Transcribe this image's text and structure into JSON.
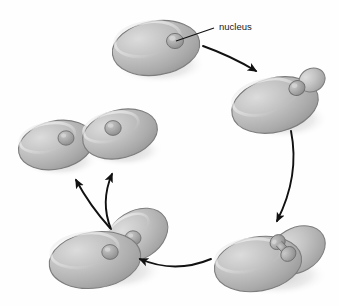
{
  "figure": {
    "background_color": "#fefefe"
  },
  "labels": {
    "nucleus": "nucleus"
  },
  "colors": {
    "cell_fill_light": "#d2d2d2",
    "cell_fill_mid": "#b4b4b4",
    "cell_fill_dark": "#9a9a9a",
    "cell_outline": "#7d7d7d",
    "nucleus_fill": "#a8a8a8",
    "nucleus_outline": "#6f6f6f",
    "shadow": "#c9c9c9",
    "arrow": "#111111",
    "leader_line": "#111111",
    "text": "#1a1a1a"
  },
  "stages": [
    {
      "id": "stage-1-parent-cell",
      "name": "unbudded parent cell",
      "position": {
        "cx": 156,
        "cy": 48
      },
      "has_bud": false,
      "nucleus_count": 1
    },
    {
      "id": "stage-2-small-bud",
      "name": "cell with small emerging bud",
      "position": {
        "cx": 277,
        "cy": 103
      },
      "has_bud": true,
      "nucleus_count": 1
    },
    {
      "id": "stage-3-large-bud-dividing-nucleus",
      "name": "cell with large bud and dividing nucleus",
      "position": {
        "cx": 268,
        "cy": 259
      },
      "has_bud": true,
      "nucleus_count": 1
    },
    {
      "id": "stage-4-separating-cells",
      "name": "parent and daughter cell separating, each with a nucleus",
      "position": {
        "cx": 108,
        "cy": 252
      },
      "has_bud": true,
      "nucleus_count": 2
    },
    {
      "id": "stage-5-daughter-cell-left",
      "name": "separated daughter cell left",
      "position": {
        "cx": 56,
        "cy": 145
      },
      "has_bud": false,
      "nucleus_count": 1
    },
    {
      "id": "stage-5-daughter-cell-right",
      "name": "separated daughter cell right",
      "position": {
        "cx": 120,
        "cy": 134
      },
      "has_bud": false,
      "nucleus_count": 1
    }
  ],
  "arrows": [
    {
      "id": "arrow-stage1-to-stage2",
      "from": "stage-1-parent-cell",
      "to": "stage-2-small-bud",
      "direction": "right-down"
    },
    {
      "id": "arrow-stage2-to-stage3",
      "from": "stage-2-small-bud",
      "to": "stage-3-large-bud-dividing-nucleus",
      "direction": "down"
    },
    {
      "id": "arrow-stage3-to-stage4",
      "from": "stage-3-large-bud-dividing-nucleus",
      "to": "stage-4-separating-cells",
      "direction": "left"
    },
    {
      "id": "arrow-stage4-to-daughter-left",
      "from": "stage-4-separating-cells",
      "to": "stage-5-daughter-cell-left",
      "direction": "up-left"
    },
    {
      "id": "arrow-stage4-to-daughter-right",
      "from": "stage-4-separating-cells",
      "to": "stage-5-daughter-cell-right",
      "direction": "up"
    }
  ],
  "callout": {
    "id": "nucleus-callout",
    "text_position": {
      "x": 219,
      "y": 30
    },
    "leader_from": {
      "x": 214,
      "y": 28
    },
    "leader_to": {
      "x": 176,
      "y": 41
    }
  }
}
